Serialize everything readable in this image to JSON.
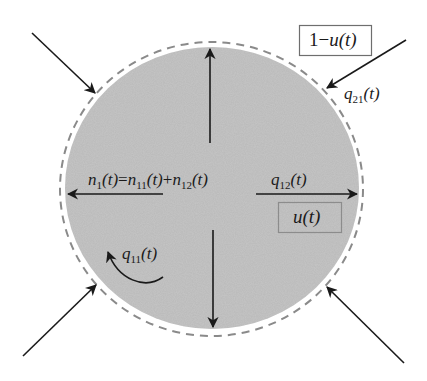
{
  "diagram": {
    "colors": {
      "background": "#ffffff",
      "cell_fill": "#b9b9b9",
      "dashed_boundary": "#8a8a8a",
      "arrow": "#1a1a1a",
      "box_border_outer": "#6e6e6e",
      "box_border_inner": "#8c8c8c"
    },
    "labels": {
      "outside_box": {
        "prefix": "1−",
        "var": "u",
        "arg": "(t)"
      },
      "inside_box": {
        "var": "u",
        "arg": "(t)"
      },
      "q21": {
        "var": "q",
        "sub": "21",
        "arg": "(t)"
      },
      "q12": {
        "var": "q",
        "sub": "12",
        "arg": "(t)"
      },
      "q11": {
        "var": "q",
        "sub": "11",
        "arg": "(t)"
      },
      "n_equation": {
        "lhs_var": "n",
        "lhs_sub": "1",
        "lhs_arg": "(t)",
        "eq": "=",
        "t1_var": "n",
        "t1_sub": "11",
        "t1_arg": "(t)",
        "plus": "+",
        "t2_var": "n",
        "t2_sub": "12",
        "t2_arg": "(t)"
      }
    },
    "arrows": {
      "inflow": [
        {
          "name": "upper-left",
          "from": [
            32,
            33
          ],
          "to": [
            95,
            93
          ]
        },
        {
          "name": "upper-right",
          "from": [
            406,
            40
          ],
          "to": [
            327,
            88
          ]
        },
        {
          "name": "lower-left",
          "from": [
            23,
            356
          ],
          "to": [
            96,
            285
          ]
        },
        {
          "name": "lower-right",
          "from": [
            404,
            363
          ],
          "to": [
            327,
            287
          ]
        }
      ],
      "internal": [
        {
          "name": "up",
          "from": [
            210,
            143
          ],
          "to": [
            210,
            47
          ]
        },
        {
          "name": "down",
          "from": [
            213,
            230
          ],
          "to": [
            213,
            329
          ]
        },
        {
          "name": "left",
          "from": [
            163,
            194
          ],
          "to": [
            66,
            194
          ]
        },
        {
          "name": "right",
          "from": [
            256,
            194
          ],
          "to": [
            359,
            194
          ]
        }
      ]
    }
  }
}
